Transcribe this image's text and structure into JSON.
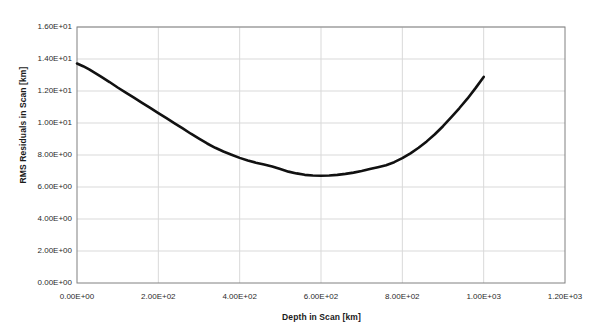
{
  "chart_data": {
    "type": "line",
    "title": "",
    "xlabel": "Depth in Scan [km]",
    "ylabel": "RMS Residuals in Scan [km]",
    "xlim": [
      0,
      1200
    ],
    "ylim": [
      0,
      16
    ],
    "grid": true,
    "legend": false,
    "line_color": "#111111",
    "line_width_px": 2.6,
    "xticks": [
      "0.00E+00",
      "2.00E+02",
      "4.00E+02",
      "6.00E+02",
      "8.00E+02",
      "1.00E+03",
      "1.20E+03"
    ],
    "xtick_values": [
      0,
      200,
      400,
      600,
      800,
      1000,
      1200
    ],
    "yticks": [
      "0.00E+00",
      "2.00E+00",
      "4.00E+00",
      "6.00E+00",
      "8.00E+00",
      "1.00E+01",
      "1.20E+01",
      "1.40E+01",
      "1.60E+01"
    ],
    "ytick_values": [
      0,
      2,
      4,
      6,
      8,
      10,
      12,
      14,
      16
    ],
    "series": [
      {
        "name": "RMS residuals vs depth",
        "x": [
          0,
          15,
          30,
          45,
          60,
          80,
          100,
          120,
          140,
          160,
          180,
          200,
          220,
          240,
          260,
          280,
          300,
          320,
          340,
          360,
          380,
          400,
          420,
          440,
          460,
          480,
          500,
          520,
          540,
          560,
          580,
          600,
          620,
          640,
          660,
          680,
          700,
          720,
          740,
          760,
          780,
          800,
          820,
          840,
          860,
          880,
          900,
          920,
          940,
          960,
          980,
          1000
        ],
        "y": [
          13.72,
          13.55,
          13.35,
          13.12,
          12.88,
          12.56,
          12.22,
          11.9,
          11.58,
          11.26,
          10.95,
          10.62,
          10.3,
          9.98,
          9.66,
          9.33,
          9.02,
          8.72,
          8.45,
          8.22,
          8.02,
          7.82,
          7.66,
          7.52,
          7.4,
          7.28,
          7.12,
          6.96,
          6.85,
          6.76,
          6.72,
          6.7,
          6.72,
          6.76,
          6.82,
          6.9,
          7.0,
          7.12,
          7.24,
          7.36,
          7.55,
          7.8,
          8.1,
          8.45,
          8.85,
          9.3,
          9.8,
          10.35,
          10.92,
          11.52,
          12.18,
          12.88
        ]
      }
    ]
  },
  "axes": {
    "y_axis_title": "RMS Residuals in Scan [km]",
    "x_axis_title": "Depth in Scan [km]"
  },
  "title_fragment": ""
}
